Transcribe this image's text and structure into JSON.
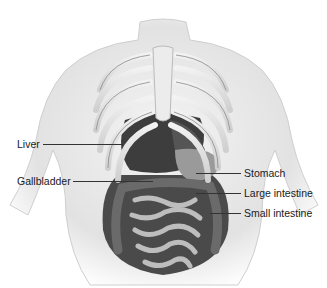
{
  "diagram": {
    "labels": [
      {
        "id": "liver",
        "text": "Liver",
        "side": "left"
      },
      {
        "id": "gallbladder",
        "text": "Gallbladder",
        "side": "left"
      },
      {
        "id": "stomach",
        "text": "Stomach",
        "side": "right"
      },
      {
        "id": "large-intestine",
        "text": "Large intestine",
        "side": "right"
      },
      {
        "id": "small-intestine",
        "text": "Small intestine",
        "side": "right"
      }
    ]
  }
}
